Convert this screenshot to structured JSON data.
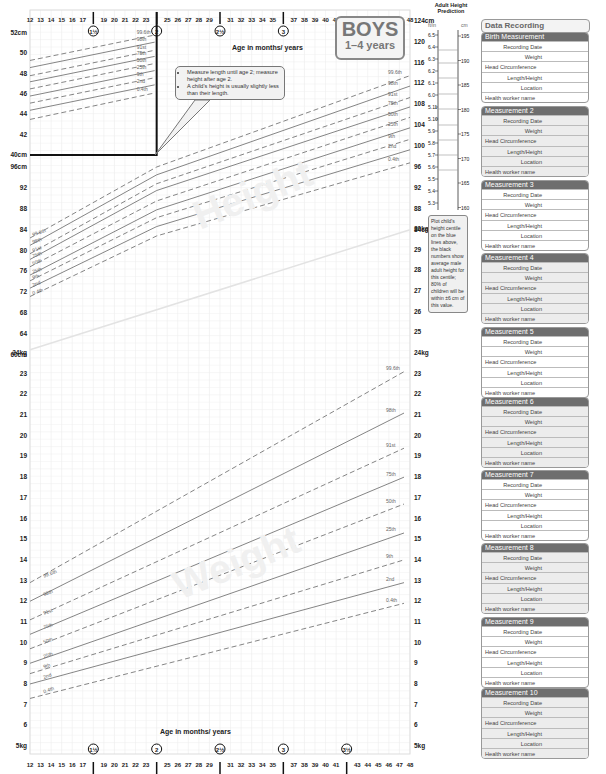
{
  "header": {
    "title_main": "BOYS",
    "title_sub": "1–4 years",
    "age_axis_label": "Age in months/ years"
  },
  "callout": {
    "bullets": [
      "Measure length until age 2; measure height after age 2.",
      "A child's height is usually slightly less than their length."
    ]
  },
  "adult_height": {
    "title": "Adult Height Prediction",
    "ft_in_labels": [
      "6.5",
      "6.4",
      "6.3",
      "6.2",
      "6.1",
      "6.0",
      "5.11",
      "5.10",
      "5.9",
      "5.8",
      "5.7",
      "5.6",
      "5.5",
      "5.4",
      "5.3"
    ],
    "cm_labels": [
      "195",
      "190",
      "185",
      "180",
      "175",
      "170",
      "165",
      "160"
    ],
    "note": "Plot child's height centile on the blue lines above, the black numbers show average male adult height for this centile; 80% of children will be within ±6 cm of this value."
  },
  "data_recording": {
    "title": "Data Recording",
    "measurements": [
      {
        "title": "Birth Measurement",
        "shaded": false
      },
      {
        "title": "Measurement 2",
        "shaded": true
      },
      {
        "title": "Measurement 3",
        "shaded": false
      },
      {
        "title": "Measurement 4",
        "shaded": true
      },
      {
        "title": "Measurement 5",
        "shaded": false
      },
      {
        "title": "Measurement 6",
        "shaded": true
      },
      {
        "title": "Measurement 7",
        "shaded": false
      },
      {
        "title": "Measurement 8",
        "shaded": true
      },
      {
        "title": "Measurement 9",
        "shaded": false
      },
      {
        "title": "Measurement 10",
        "shaded": true
      }
    ],
    "fields": [
      "Recording Date",
      "Weight",
      "Head Circumference",
      "Length/Height",
      "Location",
      "Health worker name"
    ]
  },
  "chart_data": [
    {
      "type": "line",
      "title": "Head circumference (inset)",
      "xlabel": "Age in months",
      "ylabel": "cm",
      "x": [
        12,
        24
      ],
      "ylim": [
        40,
        52
      ],
      "ytick_labels": [
        "52cm",
        "50",
        "48",
        "46",
        "44",
        "42",
        "40cm"
      ],
      "series": [
        {
          "name": "99.6th",
          "values": [
            49.3,
            51.8
          ]
        },
        {
          "name": "98th",
          "values": [
            48.6,
            51.1
          ]
        },
        {
          "name": "91st",
          "values": [
            47.8,
            50.3
          ]
        },
        {
          "name": "75th",
          "values": [
            47.2,
            49.7
          ]
        },
        {
          "name": "50th",
          "values": [
            46.5,
            49.0
          ]
        },
        {
          "name": "25th",
          "values": [
            45.8,
            48.3
          ]
        },
        {
          "name": "9th",
          "values": [
            45.1,
            47.6
          ]
        },
        {
          "name": "2nd",
          "values": [
            44.4,
            46.9
          ]
        },
        {
          "name": "0.4th",
          "values": [
            43.5,
            46.1
          ]
        }
      ]
    },
    {
      "type": "line",
      "title": "Length/Height",
      "xlabel": "Age in months/years",
      "ylabel": "cm",
      "x": [
        12,
        24,
        48
      ],
      "ylim": [
        60,
        124
      ],
      "ytick_labels_left": [
        "96cm",
        "92",
        "88",
        "84",
        "80",
        "76",
        "72",
        "68",
        "64",
        "60cm"
      ],
      "ytick_labels_right": [
        "124cm",
        "120",
        "116",
        "112",
        "108",
        "104",
        "100",
        "96",
        "92",
        "88",
        "84cm"
      ],
      "series": [
        {
          "name": "99.6th",
          "values": [
            82.4,
            96.0,
            113.5
          ]
        },
        {
          "name": "98th",
          "values": [
            81.0,
            94.5,
            111.5
          ]
        },
        {
          "name": "91st",
          "values": [
            79.4,
            92.8,
            109.3
          ]
        },
        {
          "name": "75th",
          "values": [
            78.3,
            91.5,
            107.5
          ]
        },
        {
          "name": "50th",
          "values": [
            76.9,
            89.5,
            105.5
          ]
        },
        {
          "name": "25th",
          "values": [
            75.3,
            87.8,
            103.5
          ]
        },
        {
          "name": "9th",
          "values": [
            74.2,
            86.3,
            101.3
          ]
        },
        {
          "name": "2nd",
          "values": [
            72.8,
            84.6,
            99.3
          ]
        },
        {
          "name": "0.4th",
          "values": [
            71.2,
            82.8,
            96.8
          ]
        }
      ]
    },
    {
      "type": "line",
      "title": "Weight",
      "xlabel": "Age in months/years",
      "ylabel": "kg",
      "x": [
        12,
        48
      ],
      "ylim": [
        5,
        30
      ],
      "ytick_labels": [
        "30kg",
        "29",
        "28",
        "27",
        "26",
        "25",
        "24kg",
        "23",
        "22",
        "21",
        "20",
        "19",
        "18",
        "17",
        "16",
        "15",
        "14",
        "13",
        "12",
        "11",
        "10",
        "9",
        "8",
        "7",
        "6",
        "5kg"
      ],
      "series": [
        {
          "name": "99.6th",
          "values": [
            12.9,
            23.1
          ]
        },
        {
          "name": "98th",
          "values": [
            12.0,
            21.1
          ]
        },
        {
          "name": "91st",
          "values": [
            11.1,
            19.4
          ]
        },
        {
          "name": "75th",
          "values": [
            10.4,
            18.0
          ]
        },
        {
          "name": "50th",
          "values": [
            9.7,
            16.7
          ]
        },
        {
          "name": "25th",
          "values": [
            9.0,
            15.3
          ]
        },
        {
          "name": "9th",
          "values": [
            8.5,
            14.0
          ]
        },
        {
          "name": "2nd",
          "values": [
            8.0,
            12.9
          ]
        },
        {
          "name": "0.4th",
          "values": [
            7.3,
            11.9
          ]
        }
      ]
    }
  ],
  "x_axis": {
    "month_ticks": [
      12,
      13,
      14,
      15,
      16,
      17,
      19,
      20,
      21,
      22,
      23,
      25,
      26,
      27,
      28,
      29,
      31,
      32,
      33,
      34,
      35,
      37,
      38,
      39,
      40,
      41,
      43,
      44,
      45,
      46,
      47,
      48
    ],
    "year_markers": [
      "1½",
      "2",
      "2½",
      "3",
      "3½"
    ]
  }
}
